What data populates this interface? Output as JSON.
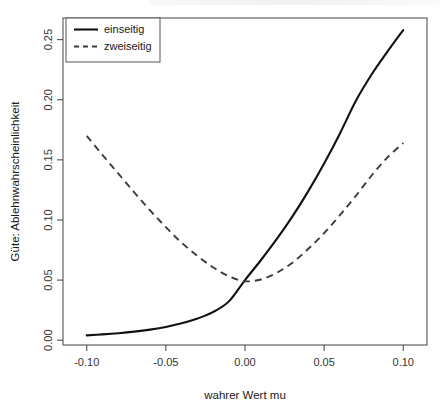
{
  "chart_data": {
    "type": "line",
    "title": "",
    "xlabel": "wahrer Wert mu",
    "ylabel": "Güte: Ablehnwahrscheinlichkeit",
    "xlim": [
      -0.115,
      0.115
    ],
    "ylim": [
      -0.004,
      0.268
    ],
    "xticks": [
      -0.1,
      -0.05,
      0.0,
      0.05,
      0.1
    ],
    "xticklabels": [
      "-0.10",
      "-0.05",
      "0.00",
      "0.05",
      "0.10"
    ],
    "yticks": [
      0.0,
      0.05,
      0.1,
      0.15,
      0.2,
      0.25
    ],
    "yticklabels": [
      "0.00",
      "0.05",
      "0.10",
      "0.15",
      "0.20",
      "0.25"
    ],
    "grid": false,
    "legend_position": "top-left",
    "box": true,
    "x": [
      -0.1,
      -0.09,
      -0.08,
      -0.07,
      -0.06,
      -0.05,
      -0.04,
      -0.03,
      -0.02,
      -0.01,
      0.0,
      0.01,
      0.02,
      0.03,
      0.04,
      0.05,
      0.06,
      0.07,
      0.08,
      0.09,
      0.1
    ],
    "series": [
      {
        "name": "einseitig",
        "style": "solid",
        "color": "#111111",
        "values": [
          0.004,
          0.0048,
          0.0058,
          0.0071,
          0.0088,
          0.011,
          0.014,
          0.018,
          0.0235,
          0.0325,
          0.05,
          0.0665,
          0.084,
          0.103,
          0.124,
          0.147,
          0.172,
          0.199,
          0.221,
          0.24,
          0.258
        ]
      },
      {
        "name": "zweiseitig",
        "style": "dashed",
        "color": "#3c3c3c",
        "values": [
          0.17,
          0.154,
          0.1385,
          0.123,
          0.108,
          0.094,
          0.081,
          0.07,
          0.0605,
          0.053,
          0.049,
          0.0505,
          0.056,
          0.0645,
          0.076,
          0.089,
          0.104,
          0.12,
          0.137,
          0.152,
          0.164
        ]
      }
    ],
    "legend_entries": [
      {
        "label": "einseitig",
        "style": "solid"
      },
      {
        "label": "zweiseitig",
        "style": "dashed"
      }
    ]
  }
}
